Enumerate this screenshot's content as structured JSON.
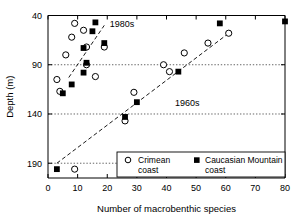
{
  "chart_data": {
    "type": "scatter",
    "title": "",
    "xlabel": "Number of macrobenthic species",
    "ylabel": "Depth (m)",
    "xlim": [
      0,
      80
    ],
    "ylim": [
      40,
      205
    ],
    "y_inverted": true,
    "xticks": [
      0,
      10,
      20,
      30,
      40,
      50,
      60,
      70,
      80
    ],
    "yticks": [
      40,
      90,
      140,
      190
    ],
    "xtick_labels": [
      "0",
      "10",
      "20",
      "30",
      "40",
      "50",
      "60",
      "70",
      "80"
    ],
    "ytick_labels": [
      "40",
      "90",
      "140",
      "190"
    ],
    "grid": "horizontal-dotted",
    "gridlines_y": [
      90,
      140,
      190
    ],
    "legend_position": "bottom-right",
    "series": [
      {
        "name": "Crimean coast",
        "marker": "open-circle",
        "color": "#000000",
        "points": [
          [
            9,
            48
          ],
          [
            12,
            55
          ],
          [
            8,
            62
          ],
          [
            13,
            72
          ],
          [
            13,
            90
          ],
          [
            6,
            80
          ],
          [
            3,
            105
          ],
          [
            4,
            117
          ],
          [
            19,
            72
          ],
          [
            16,
            102
          ],
          [
            39,
            90
          ],
          [
            41,
            97
          ],
          [
            46,
            78
          ],
          [
            54,
            68
          ],
          [
            61,
            58
          ],
          [
            26,
            147
          ],
          [
            29,
            118
          ],
          [
            9,
            196
          ]
        ]
      },
      {
        "name": "Caucasian Mountain coast",
        "marker": "filled-square",
        "color": "#000000",
        "points": [
          [
            16,
            47
          ],
          [
            15,
            56
          ],
          [
            19,
            68
          ],
          [
            12,
            73
          ],
          [
            13,
            88
          ],
          [
            12,
            98
          ],
          [
            8,
            110
          ],
          [
            5,
            119
          ],
          [
            44,
            97
          ],
          [
            58,
            48
          ],
          [
            30,
            128
          ],
          [
            26,
            143
          ],
          [
            3,
            196
          ],
          [
            80,
            46
          ]
        ]
      }
    ],
    "trend_lines": [
      {
        "label": "1980s",
        "x1": 7,
        "y1": 103,
        "x2": 19,
        "y2": 50
      },
      {
        "label": "1960s",
        "x1": 3,
        "y1": 190,
        "x2": 61,
        "y2": 58
      }
    ],
    "annotations": [
      {
        "text": "1980s",
        "x": 25,
        "y": 52
      },
      {
        "text": "1960s",
        "x": 47,
        "y": 132
      }
    ]
  },
  "legend": {
    "entries": [
      {
        "label_line1": "Crimean",
        "label_line2": "coast",
        "marker": "open-circle"
      },
      {
        "label_line1": "Caucasian Mountain",
        "label_line2": "coast",
        "marker": "filled-square"
      }
    ]
  }
}
